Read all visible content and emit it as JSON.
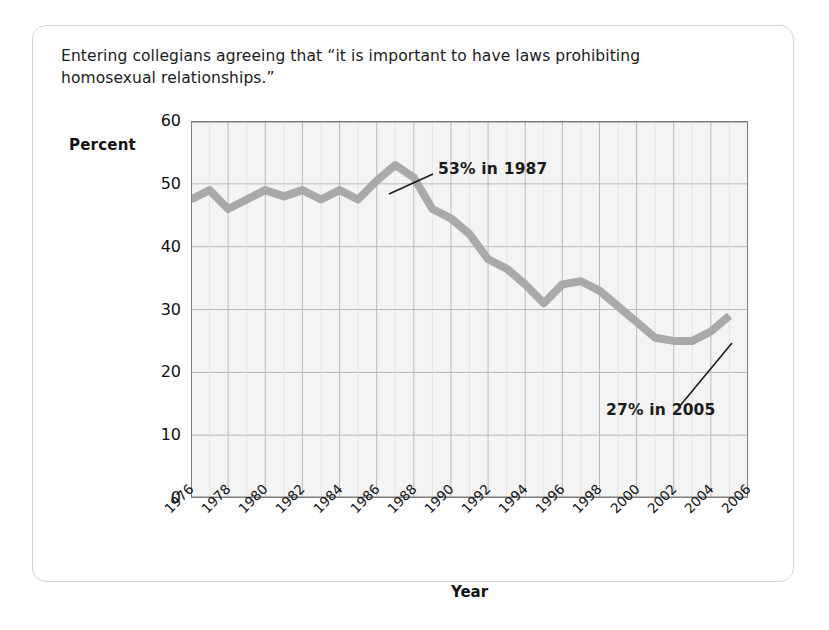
{
  "caption": "Entering collegians agreeing that “it is important to have laws prohibiting homosexual relationships.”",
  "axis": {
    "y_title": "Percent",
    "x_title": "Year"
  },
  "annotations": {
    "peak": "53% in 1987",
    "end": "27% in 2005"
  },
  "colors": {
    "line": "#a9a9a9",
    "plot_background": "#f4f4f4",
    "grid": "#b9b9b9",
    "axis": "#7d7d7d",
    "card_border": "#d6d6d6",
    "text": "#1b1b1b"
  },
  "chart_data": {
    "type": "line",
    "title": "Entering collegians agreeing that “it is important to have laws prohibiting homosexual relationships.”",
    "xlabel": "Year",
    "ylabel": "Percent",
    "xlim": [
      1976,
      2006
    ],
    "ylim": [
      0,
      60
    ],
    "yticks": [
      0,
      10,
      20,
      30,
      40,
      50,
      60
    ],
    "xticks": [
      1976,
      1978,
      1980,
      1982,
      1984,
      1986,
      1988,
      1990,
      1992,
      1994,
      1996,
      1998,
      2000,
      2002,
      2004,
      2006
    ],
    "grid": true,
    "legend": "none",
    "series": [
      {
        "name": "Percent agreeing",
        "x": [
          1976,
          1977,
          1978,
          1979,
          1980,
          1981,
          1982,
          1983,
          1984,
          1985,
          1986,
          1987,
          1988,
          1989,
          1990,
          1991,
          1992,
          1993,
          1994,
          1995,
          1996,
          1997,
          1998,
          1999,
          2000,
          2001,
          2002,
          2003,
          2004,
          2005
        ],
        "values": [
          47.5,
          49.0,
          46.0,
          47.5,
          49.0,
          48.0,
          49.0,
          47.5,
          49.0,
          47.5,
          50.5,
          53.0,
          51.0,
          46.0,
          44.5,
          42.0,
          38.0,
          36.5,
          34.0,
          31.0,
          34.0,
          34.5,
          33.0,
          30.5,
          28.0,
          25.5,
          25.0,
          25.0,
          26.5,
          29.0
        ]
      }
    ],
    "annotations": [
      {
        "text": "53% in 1987",
        "x": 1987,
        "y": 53
      },
      {
        "text": "27% in 2005",
        "x": 2005,
        "y": 29
      }
    ]
  }
}
